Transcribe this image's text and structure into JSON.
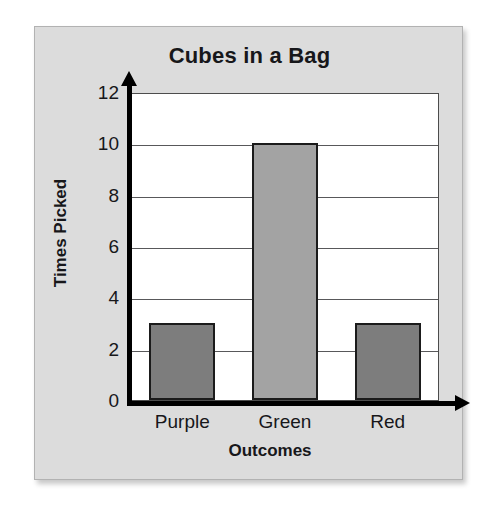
{
  "chart_data": {
    "type": "bar",
    "title": "Cubes in a Bag",
    "xlabel": "Outcomes",
    "ylabel": "Times Picked",
    "categories": [
      "Purple",
      "Green",
      "Red"
    ],
    "values": [
      3,
      10,
      3
    ],
    "ylim": [
      0,
      12
    ],
    "yticks": [
      0,
      2,
      4,
      6,
      8,
      10,
      12
    ],
    "ytick_labels": [
      "0",
      "2",
      "4",
      "6",
      "8",
      "10",
      "12"
    ],
    "gridlines": [
      2,
      4,
      6,
      8,
      10
    ],
    "grid": true,
    "legend": null,
    "bar_colors": [
      "#7d7d7d",
      "#a3a3a3",
      "#7d7d7d"
    ],
    "bar_edge_color": "#1b1b1b"
  },
  "style": {
    "page_background": "#ffffff",
    "panel_background": "#dcdcdc",
    "panel_border": "#b2b2b2",
    "plot_background": "#ffffff",
    "axis_color": "#000000",
    "gridline_color": "#58585a",
    "text_color": "#17171a"
  }
}
